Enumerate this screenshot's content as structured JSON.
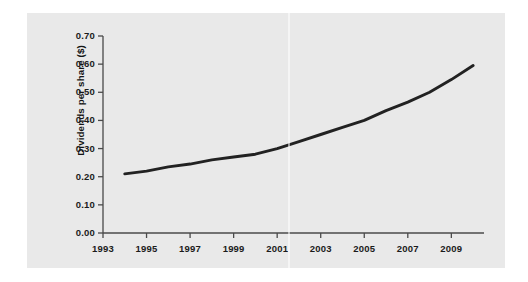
{
  "chart_data": {
    "type": "line",
    "title": "",
    "subtitle": "",
    "xlabel": "",
    "ylabel": "Dividends per share ($)",
    "x": [
      1994,
      1995,
      1996,
      1997,
      1998,
      1999,
      2000,
      2001,
      2002,
      2003,
      2004,
      2005,
      2006,
      2007,
      2008,
      2009,
      2010
    ],
    "values": [
      0.21,
      0.22,
      0.235,
      0.245,
      0.26,
      0.27,
      0.28,
      0.3,
      0.325,
      0.35,
      0.375,
      0.4,
      0.435,
      0.465,
      0.5,
      0.545,
      0.595
    ],
    "series": [
      {
        "name": "Dividends per share",
        "color": "#222222",
        "values": [
          0.21,
          0.22,
          0.235,
          0.245,
          0.26,
          0.27,
          0.28,
          0.3,
          0.325,
          0.35,
          0.375,
          0.4,
          0.435,
          0.465,
          0.5,
          0.545,
          0.595
        ]
      }
    ],
    "xlim": [
      1993,
      2010.5
    ],
    "ylim": [
      0.0,
      0.7
    ],
    "xticks": [
      1993,
      1995,
      1997,
      1999,
      2001,
      2003,
      2005,
      2007,
      2009
    ],
    "xtick_labels": [
      "1993",
      "1995",
      "1997",
      "1999",
      "2001",
      "2003",
      "2005",
      "2007",
      "2009"
    ],
    "yticks": [
      0.0,
      0.1,
      0.2,
      0.3,
      0.4,
      0.5,
      0.6,
      0.7
    ],
    "ytick_labels": [
      "0.00",
      "0.10",
      "0.20",
      "0.30",
      "0.40",
      "0.50",
      "0.60",
      "0.70"
    ],
    "grid": false,
    "legend": false,
    "legend_position": "none",
    "annotations": []
  },
  "figure": {
    "panel_background": "#e9e9e9",
    "page_background": "#ffffff",
    "axis_color": "#4a4a4a",
    "line_color": "#222222",
    "text_color": "#1b1b1b"
  }
}
